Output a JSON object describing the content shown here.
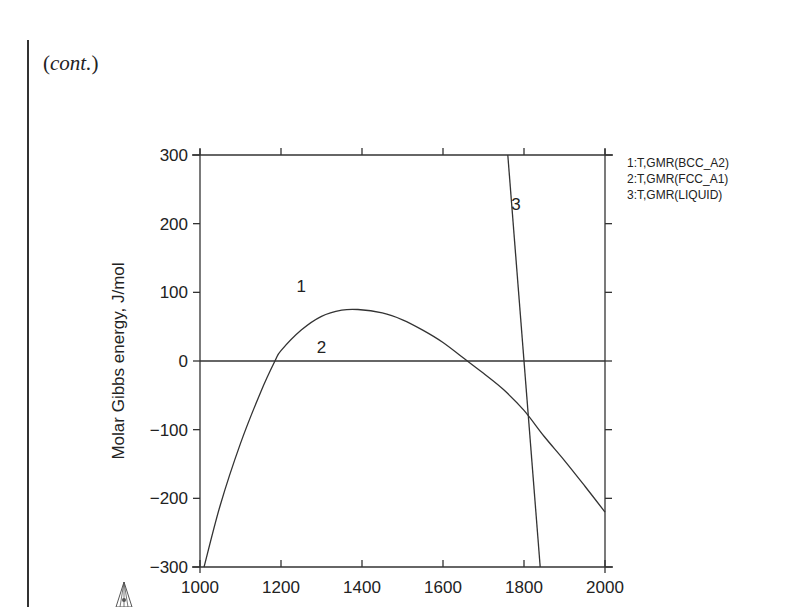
{
  "page": {
    "continuation_prefix": "(",
    "continuation_word": "cont.",
    "continuation_suffix": ")"
  },
  "chart_data": {
    "type": "line",
    "title": "",
    "xlabel": "",
    "ylabel": "Molar Gibbs energy, J/mol",
    "xlim": [
      1000,
      2000
    ],
    "ylim": [
      -300,
      300
    ],
    "x_ticks": [
      1000,
      1200,
      1400,
      1600,
      1800,
      2000
    ],
    "x_tick_labels": [
      "1000",
      "1200",
      "1400",
      "1600",
      "1800",
      "2000"
    ],
    "y_ticks": [
      -300,
      -200,
      -100,
      0,
      100,
      200,
      300
    ],
    "y_tick_labels": [
      "−300",
      "−200",
      "−100",
      "0",
      "100",
      "200",
      "300"
    ],
    "grid": false,
    "legend_position": "right-outside-top",
    "legend": [
      "1:T,GMR(BCC_A2)",
      "2:T,GMR(FCC_A1)",
      "3:T,GMR(LIQUID)"
    ],
    "series": [
      {
        "name": "1:T,GMR(BCC_A2)",
        "label": "1",
        "label_at": [
          1250,
          100
        ],
        "x": [
          1010,
          1050,
          1100,
          1150,
          1185,
          1200,
          1250,
          1300,
          1350,
          1390,
          1450,
          1500,
          1550,
          1600,
          1660,
          1700,
          1750,
          1800,
          1850,
          1900,
          1950,
          2000
        ],
        "y": [
          -300,
          -210,
          -120,
          -45,
          0,
          15,
          45,
          65,
          74,
          75,
          70,
          60,
          45,
          27,
          0,
          -18,
          -42,
          -72,
          -110,
          -145,
          -182,
          -220
        ]
      },
      {
        "name": "2:T,GMR(FCC_A1)",
        "label": "2",
        "label_at": [
          1300,
          12
        ],
        "x": [
          1000,
          2000
        ],
        "y": [
          0,
          0
        ]
      },
      {
        "name": "3:T,GMR(LIQUID)",
        "label": "3",
        "label_at": [
          1780,
          220
        ],
        "x": [
          1760,
          1840
        ],
        "y": [
          300,
          -300
        ]
      }
    ]
  }
}
